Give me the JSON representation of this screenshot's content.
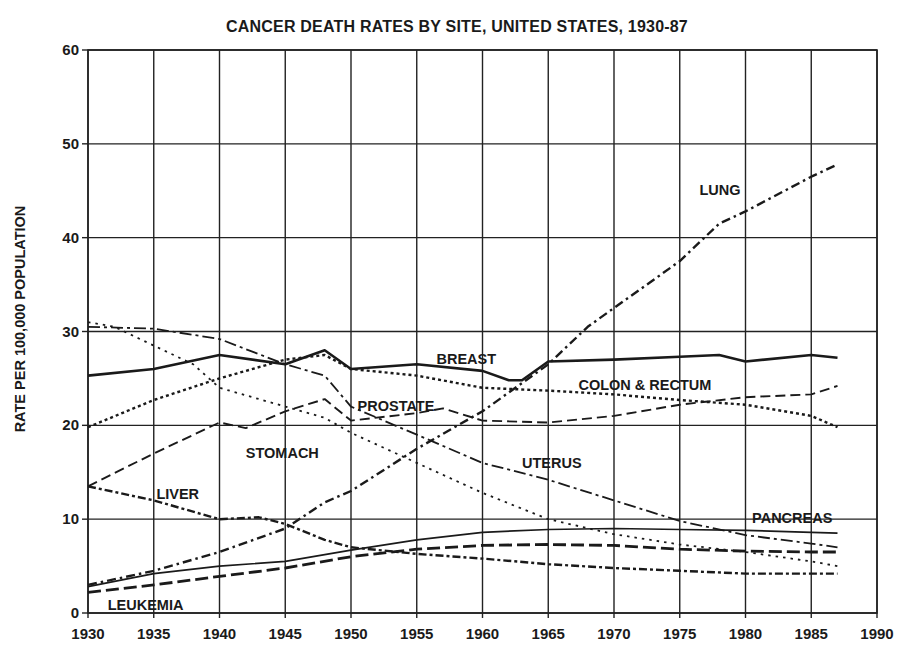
{
  "chart_data": {
    "type": "line",
    "title": "CANCER DEATH RATES BY SITE, UNITED STATES, 1930-87",
    "xlabel": "",
    "ylabel": "RATE PER 100,000 POPULATION",
    "xlim": [
      1930,
      1990
    ],
    "ylim": [
      0,
      60
    ],
    "xticks": [
      1930,
      1935,
      1940,
      1945,
      1950,
      1955,
      1960,
      1965,
      1970,
      1975,
      1980,
      1985,
      1990
    ],
    "yticks": [
      0,
      10,
      20,
      30,
      40,
      50,
      60
    ],
    "grid": true,
    "legend": "inline labels",
    "series": [
      {
        "name": "LUNG",
        "style": "dash-dot",
        "x": [
          1930,
          1935,
          1940,
          1945,
          1948,
          1950,
          1955,
          1960,
          1965,
          1968,
          1970,
          1975,
          1978,
          1980,
          1985,
          1987
        ],
        "values": [
          3.0,
          4.5,
          6.5,
          9.0,
          11.8,
          13.0,
          17.5,
          21.5,
          26.5,
          30.5,
          32.5,
          37.5,
          41.5,
          42.8,
          46.5,
          47.8
        ],
        "label_pos": [
          1976.5,
          44.5
        ]
      },
      {
        "name": "BREAST",
        "style": "solid-thick",
        "x": [
          1930,
          1935,
          1940,
          1945,
          1948,
          1950,
          1955,
          1960,
          1962,
          1963,
          1965,
          1970,
          1975,
          1978,
          1980,
          1985,
          1987
        ],
        "values": [
          25.3,
          26.0,
          27.5,
          26.5,
          28.0,
          26.0,
          26.5,
          25.8,
          24.8,
          24.8,
          26.8,
          27.0,
          27.3,
          27.5,
          26.8,
          27.5,
          27.2
        ],
        "label_pos": [
          1956.5,
          26.5
        ]
      },
      {
        "name": "COLON & RECTUM",
        "style": "dotted-fine",
        "x": [
          1930,
          1935,
          1940,
          1945,
          1948,
          1950,
          1955,
          1960,
          1965,
          1970,
          1975,
          1980,
          1985,
          1987
        ],
        "values": [
          19.8,
          22.7,
          25.0,
          27.0,
          27.5,
          26.0,
          25.3,
          24.0,
          23.7,
          23.3,
          22.7,
          22.2,
          21.0,
          19.8
        ],
        "label_pos": [
          1967.3,
          23.8
        ]
      },
      {
        "name": "PROSTATE",
        "style": "dashed",
        "x": [
          1930,
          1935,
          1940,
          1942,
          1945,
          1948,
          1950,
          1955,
          1957,
          1960,
          1965,
          1970,
          1975,
          1980,
          1985,
          1987
        ],
        "values": [
          13.5,
          17.0,
          20.3,
          19.7,
          21.5,
          22.8,
          20.5,
          21.3,
          21.8,
          20.5,
          20.3,
          21.0,
          22.2,
          23.0,
          23.3,
          24.2
        ],
        "label_pos": [
          1950.5,
          21.5
        ]
      },
      {
        "name": "STOMACH",
        "style": "dotted",
        "x": [
          1930,
          1932,
          1935,
          1938,
          1940,
          1945,
          1948,
          1950,
          1955,
          1960,
          1965,
          1970,
          1975,
          1980,
          1985,
          1987
        ],
        "values": [
          31.0,
          30.5,
          28.5,
          26.5,
          24.0,
          22.0,
          20.8,
          19.2,
          16.0,
          12.8,
          10.0,
          8.4,
          7.3,
          6.5,
          5.5,
          5.0
        ],
        "label_pos": [
          1942.0,
          16.5
        ]
      },
      {
        "name": "UTERUS",
        "style": "long-dash-dot",
        "x": [
          1930,
          1935,
          1940,
          1945,
          1948,
          1950,
          1955,
          1960,
          1965,
          1970,
          1975,
          1980,
          1985,
          1987
        ],
        "values": [
          30.5,
          30.3,
          29.2,
          26.5,
          25.3,
          22.0,
          19.0,
          16.0,
          14.2,
          12.0,
          9.8,
          8.3,
          7.4,
          7.0
        ],
        "label_pos": [
          1963.0,
          15.5
        ]
      },
      {
        "name": "LIVER",
        "style": "dash-dot-heavy",
        "x": [
          1930,
          1935,
          1940,
          1943,
          1945,
          1948,
          1950,
          1955,
          1960,
          1965,
          1970,
          1975,
          1980,
          1985,
          1987
        ],
        "values": [
          13.5,
          12.0,
          10.0,
          10.2,
          9.5,
          7.8,
          7.0,
          6.3,
          5.8,
          5.2,
          4.8,
          4.5,
          4.2,
          4.2,
          4.2
        ],
        "label_pos": [
          1935.2,
          12.2
        ]
      },
      {
        "name": "PANCREAS",
        "style": "solid-thin",
        "x": [
          1930,
          1935,
          1940,
          1945,
          1950,
          1955,
          1960,
          1965,
          1970,
          1975,
          1980,
          1985,
          1987
        ],
        "values": [
          2.8,
          4.2,
          5.0,
          5.5,
          6.7,
          7.8,
          8.6,
          8.9,
          9.0,
          8.9,
          8.8,
          8.6,
          8.5
        ],
        "label_pos": [
          1980.5,
          9.6
        ]
      },
      {
        "name": "LEUKEMIA",
        "style": "long-dash",
        "x": [
          1930,
          1935,
          1940,
          1945,
          1950,
          1955,
          1960,
          1965,
          1970,
          1975,
          1980,
          1985,
          1987
        ],
        "values": [
          2.2,
          3.0,
          3.9,
          4.8,
          6.0,
          6.8,
          7.2,
          7.3,
          7.2,
          6.8,
          6.6,
          6.5,
          6.5
        ],
        "label_pos": [
          1931.5,
          0.3
        ]
      }
    ]
  }
}
